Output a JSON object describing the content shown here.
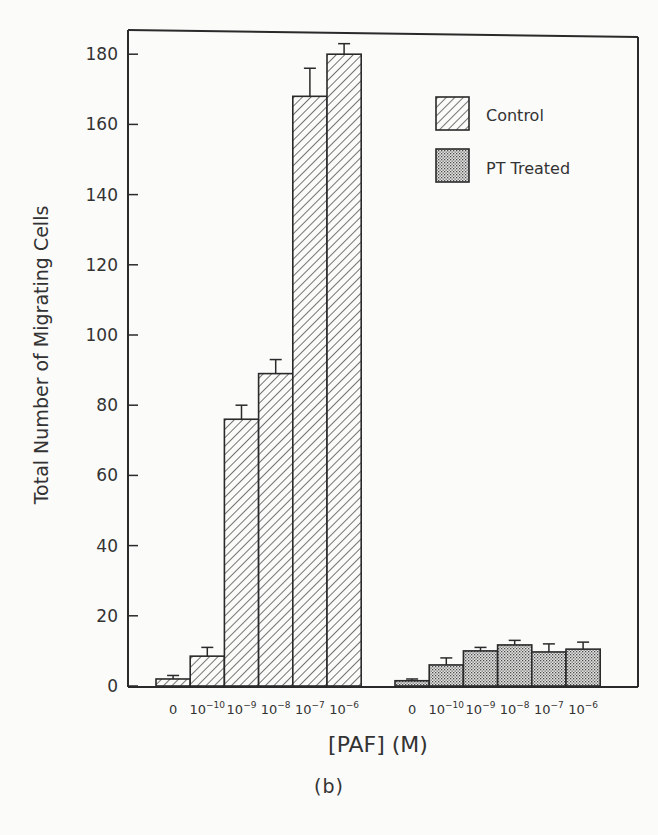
{
  "chart_data": {
    "type": "bar",
    "title": "",
    "panel_label": "(b)",
    "xlabel": "[PAF] (M)",
    "ylabel": "Total Number of Migrating Cells",
    "ylim": [
      0,
      185
    ],
    "yticks": [
      0,
      20,
      40,
      60,
      80,
      100,
      120,
      140,
      160,
      180
    ],
    "grid": false,
    "legend_position": "upper right",
    "categories": [
      "0",
      "10^-10",
      "10^-9",
      "10^-8",
      "10^-7",
      "10^-6"
    ],
    "category_labels": [
      {
        "base": "0",
        "exp": ""
      },
      {
        "base": "10",
        "exp": "−10"
      },
      {
        "base": "10",
        "exp": "−9"
      },
      {
        "base": "10",
        "exp": "−8"
      },
      {
        "base": "10",
        "exp": "−7"
      },
      {
        "base": "10",
        "exp": "−6"
      }
    ],
    "series": [
      {
        "name": "Control",
        "pattern": "diagonal-hatch",
        "values": [
          2,
          8.5,
          76,
          89,
          168,
          180
        ],
        "error_upper": [
          3,
          11,
          80,
          93,
          176,
          183
        ]
      },
      {
        "name": "PT Treated",
        "pattern": "stipple",
        "values": [
          1.5,
          6,
          10,
          11.7,
          9.7,
          10.5
        ],
        "error_upper": [
          2,
          8,
          11,
          13,
          12,
          12.5
        ]
      }
    ]
  },
  "legend": {
    "items": [
      {
        "label": "Control",
        "pattern": "diagonal-hatch"
      },
      {
        "label": "PT Treated",
        "pattern": "stipple"
      }
    ]
  },
  "colors": {
    "ink": "#2a2a2a",
    "background": "#fbfbfa"
  }
}
